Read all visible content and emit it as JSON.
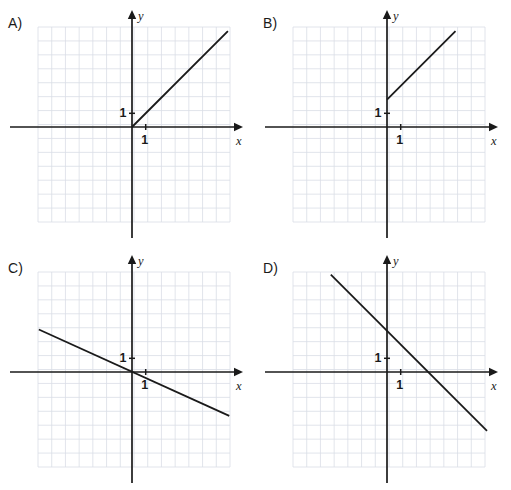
{
  "page": {
    "background_color": "#ffffff",
    "ink_color": "#1a1a1a",
    "grid_color": "#d9dde6",
    "width": 511,
    "height": 490
  },
  "common": {
    "x_axis_label": "x",
    "y_axis_label": "y",
    "unit_label_x": "1",
    "unit_label_y": "1",
    "grid_cell_px": 13.7,
    "grid_cols": 14,
    "grid_rows": 14
  },
  "panels": [
    {
      "id": "A",
      "label": "A)",
      "chart_data": {
        "type": "line",
        "title": "A)",
        "xlabel": "x",
        "ylabel": "y",
        "grid": true,
        "legend": "none",
        "xlim": [
          -7,
          7
        ],
        "ylim": [
          -7,
          7
        ],
        "x_tick_labels": [
          "1"
        ],
        "y_tick_labels": [
          "1"
        ],
        "series": [
          {
            "name": "ray",
            "slope": 1,
            "intercept": 0,
            "x": [
              0,
              7
            ],
            "values": [
              0,
              7
            ],
            "style": "solid"
          }
        ]
      }
    },
    {
      "id": "B",
      "label": "B)",
      "chart_data": {
        "type": "line",
        "title": "B)",
        "xlabel": "x",
        "ylabel": "y",
        "grid": true,
        "legend": "none",
        "xlim": [
          -7,
          7
        ],
        "ylim": [
          -7,
          7
        ],
        "x_tick_labels": [
          "1"
        ],
        "y_tick_labels": [
          "1"
        ],
        "series": [
          {
            "name": "ray",
            "slope": 1,
            "intercept": 2,
            "x": [
              0,
              5
            ],
            "values": [
              2,
              7
            ],
            "style": "solid"
          }
        ]
      }
    },
    {
      "id": "C",
      "label": "C)",
      "chart_data": {
        "type": "line",
        "title": "C)",
        "xlabel": "x",
        "ylabel": "y",
        "grid": true,
        "legend": "none",
        "xlim": [
          -7,
          7
        ],
        "ylim": [
          -7,
          7
        ],
        "x_tick_labels": [
          "1"
        ],
        "y_tick_labels": [
          "1"
        ],
        "series": [
          {
            "name": "line",
            "slope": -0.45,
            "intercept": 0,
            "x": [
              -6.8,
              7.1
            ],
            "values": [
              3.1,
              -3.2
            ],
            "style": "solid"
          }
        ]
      }
    },
    {
      "id": "D",
      "label": "D)",
      "chart_data": {
        "type": "line",
        "title": "D)",
        "xlabel": "x",
        "ylabel": "y",
        "grid": true,
        "legend": "none",
        "xlim": [
          -7,
          7
        ],
        "ylim": [
          -7,
          7
        ],
        "x_tick_labels": [
          "1"
        ],
        "y_tick_labels": [
          "1"
        ],
        "series": [
          {
            "name": "line",
            "slope": -1,
            "intercept": 3,
            "x": [
              -4.1,
              7.3
            ],
            "values": [
              7.1,
              -4.3
            ],
            "style": "solid"
          }
        ]
      }
    }
  ]
}
